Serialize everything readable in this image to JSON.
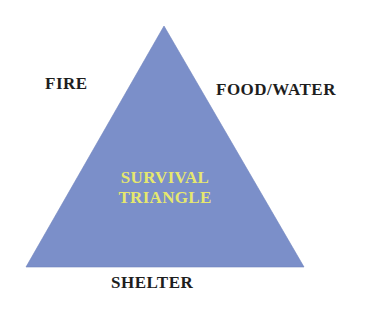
{
  "diagram": {
    "type": "triangle",
    "title_lines": [
      "SURVIVAL",
      "TRIANGLE"
    ],
    "vertices": {
      "left": "FIRE",
      "right": "FOOD/WATER",
      "bottom": "SHELTER"
    },
    "colors": {
      "triangle_fill": "#7b8fc9",
      "title_text": "#e6e86e",
      "label_text": "#1e1e1e",
      "background": "#ffffff"
    }
  }
}
